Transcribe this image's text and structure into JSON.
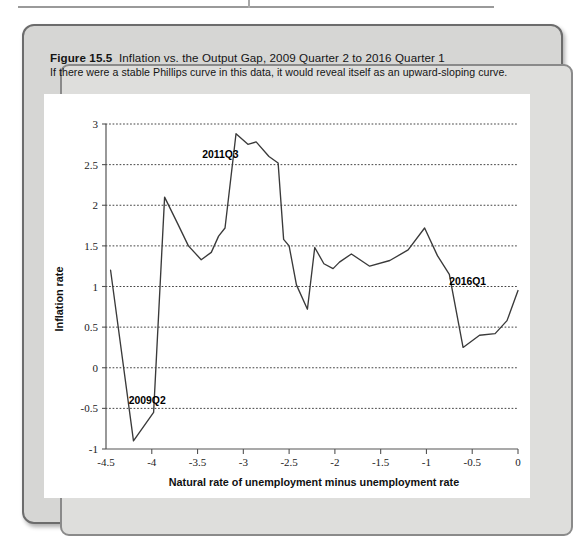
{
  "figure": {
    "number_label": "Figure 15.5",
    "title": "Inflation vs. the Output Gap, 2009 Quarter 2 to 2016 Quarter 1",
    "subtitle": "If there were a stable Phillips curve in this data, it would reveal itself as an upward-sloping curve."
  },
  "chart_data": {
    "type": "line",
    "title": "Inflation vs. the Output Gap, 2009 Quarter 2 to 2016 Quarter 1",
    "xlabel": "Natural rate of unemployment minus unemployment rate",
    "ylabel": "Inflation rate",
    "xlim": [
      -4.5,
      0
    ],
    "ylim": [
      -1,
      3
    ],
    "xticks": [
      -4.5,
      -4,
      -3.5,
      -3,
      -2.5,
      -2,
      -1.5,
      -1,
      -0.5,
      0
    ],
    "xtick_labels": [
      "-4.5",
      "-4",
      "-3.5",
      "-3",
      "-2.5",
      "-2",
      "-1.5",
      "-1",
      "-0.5",
      "0"
    ],
    "yticks": [
      -1,
      -0.5,
      0,
      0.5,
      1,
      1.5,
      2,
      2.5,
      3
    ],
    "ytick_labels": [
      "-1",
      "-0.5",
      "0",
      "0.5",
      "1",
      "1.5",
      "2",
      "2.5",
      "3"
    ],
    "grid": "horizontal-dotted",
    "legend": "none",
    "series": [
      {
        "name": "Inflation rate vs. output gap",
        "x": [
          -4.45,
          -4.2,
          -3.98,
          -3.86,
          -3.72,
          -3.6,
          -3.46,
          -3.35,
          -3.27,
          -3.2,
          -3.08,
          -2.95,
          -2.86,
          -2.72,
          -2.62,
          -2.56,
          -2.5,
          -2.42,
          -2.3,
          -2.22,
          -2.12,
          -2.02,
          -1.95,
          -1.82,
          -1.62,
          -1.4,
          -1.2,
          -1.02,
          -0.88,
          -0.75,
          -0.6,
          -0.42,
          -0.25,
          -0.12,
          0.0
        ],
        "y": [
          1.2,
          -0.9,
          -0.55,
          2.1,
          1.78,
          1.5,
          1.33,
          1.42,
          1.62,
          1.72,
          2.88,
          2.75,
          2.78,
          2.6,
          2.52,
          1.58,
          1.5,
          1.02,
          0.72,
          1.48,
          1.28,
          1.22,
          1.3,
          1.4,
          1.25,
          1.32,
          1.45,
          1.72,
          1.38,
          1.15,
          0.25,
          0.4,
          0.42,
          0.58,
          0.95
        ]
      }
    ],
    "annotations": [
      {
        "text": "2009Q2",
        "x": -4.2,
        "y": -0.9,
        "label_x": -4.05,
        "label_y": -0.45
      },
      {
        "text": "2011Q3",
        "x": -3.08,
        "y": 2.88,
        "label_x": -3.25,
        "label_y": 2.58
      },
      {
        "text": "2016Q1",
        "x": 0.0,
        "y": 0.95,
        "label_x": -0.55,
        "label_y": 1.02
      }
    ]
  }
}
